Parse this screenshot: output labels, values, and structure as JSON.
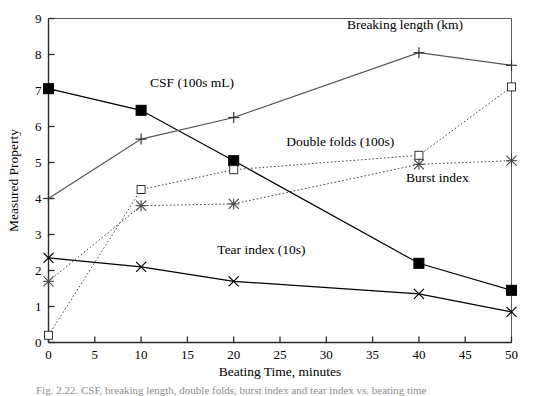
{
  "chart_data": {
    "type": "line",
    "title": "",
    "xlabel": "Beating Time, minutes",
    "ylabel": "Measured Property",
    "xlim": [
      0,
      50
    ],
    "ylim": [
      0,
      9
    ],
    "xticks": [
      0,
      5,
      10,
      15,
      20,
      25,
      30,
      35,
      40,
      45,
      50
    ],
    "yticks": [
      0,
      1,
      2,
      3,
      4,
      5,
      6,
      7,
      8,
      9
    ],
    "xtick_labels": [
      "0",
      "5",
      "10",
      "15",
      "20",
      "25",
      "30",
      "35",
      "40",
      "45",
      "50"
    ],
    "ytick_labels": [
      "0",
      "1",
      "2",
      "3",
      "4",
      "5",
      "6",
      "7",
      "8",
      "9"
    ],
    "grid": false,
    "legend": "inline-annotations",
    "x": [
      0,
      10,
      20,
      40,
      50
    ],
    "series": [
      {
        "name": "CSF (100s mL)",
        "marker": "filled-square",
        "line": "solid",
        "color": "#000000",
        "values": [
          7.05,
          6.45,
          5.05,
          2.2,
          1.45
        ],
        "label_x": 15.5,
        "label_y": 7.1
      },
      {
        "name": "Breaking length (km)",
        "marker": "plus",
        "line": "solid",
        "color": "#555555",
        "values": [
          4.0,
          5.65,
          6.25,
          8.05,
          7.7
        ],
        "label_x": 38.5,
        "label_y": 8.7
      },
      {
        "name": "Double folds (100s)",
        "marker": "open-square",
        "line": "dotted",
        "color": "#444444",
        "values": [
          0.2,
          4.25,
          4.8,
          5.2,
          7.1
        ],
        "label_x": 31.5,
        "label_y": 5.45
      },
      {
        "name": "Burst index",
        "marker": "star-x",
        "line": "dotted",
        "color": "#444444",
        "values": [
          1.7,
          3.8,
          3.85,
          4.95,
          5.05
        ],
        "label_x": 42.0,
        "label_y": 4.45
      },
      {
        "name": "Tear index (10s)",
        "marker": "x-cross",
        "line": "solid",
        "color": "#000000",
        "values": [
          2.35,
          2.1,
          1.7,
          1.35,
          0.85
        ],
        "label_x": 23.0,
        "label_y": 2.45
      }
    ]
  },
  "caption": {
    "text": "Fig. 2.22. CSF, breaking length, double folds, burst index and tear index vs. beating time"
  }
}
